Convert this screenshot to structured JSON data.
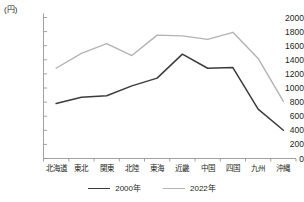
{
  "chart_data": {
    "type": "line",
    "title": "",
    "unit_label": "(円)",
    "xlabel": "",
    "ylabel": "",
    "categories": [
      "北海道",
      "東北",
      "関東",
      "北陸",
      "東海",
      "近畿",
      "中国",
      "四国",
      "九州",
      "沖縄"
    ],
    "ylim": [
      0,
      2000
    ],
    "yticks": [
      0,
      200,
      400,
      600,
      800,
      1000,
      1200,
      1400,
      1600,
      1800,
      2000
    ],
    "grid": false,
    "legend_position": "bottom",
    "series": [
      {
        "name": "2000年",
        "color": "#3b3b3b",
        "values": [
          780,
          870,
          890,
          1030,
          1140,
          1480,
          1280,
          1290,
          700,
          400
        ]
      },
      {
        "name": "2022年",
        "color": "#b3b3b3",
        "values": [
          1280,
          1490,
          1630,
          1460,
          1750,
          1740,
          1690,
          1790,
          1420,
          810
        ]
      }
    ]
  }
}
